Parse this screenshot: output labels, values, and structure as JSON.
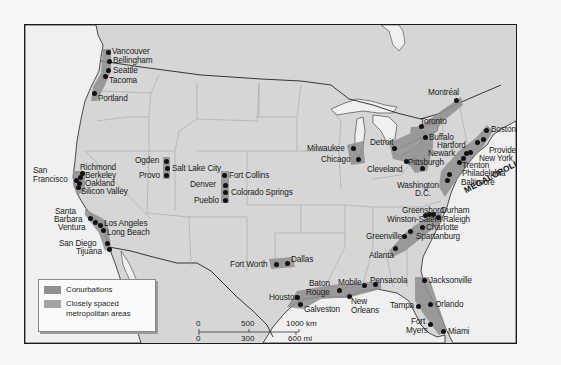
{
  "map": {
    "title": "Megalopolis and conurbations of North America",
    "colors": {
      "land": "#d6d6d6",
      "water": "#f0f0f0",
      "conurbation": "#8a8a8a",
      "metro_spaced": "#a3a3a3",
      "border": "#1a1a1a"
    },
    "region_label": "MEGALOPOLIS",
    "cities": [
      {
        "name": "Vancouver",
        "x": 107,
        "y": 51
      },
      {
        "name": "Bellingham",
        "x": 108,
        "y": 60
      },
      {
        "name": "Seattle",
        "x": 107,
        "y": 69
      },
      {
        "name": "Tacoma",
        "x": 104,
        "y": 75
      },
      {
        "name": "Portland",
        "x": 93,
        "y": 92
      },
      {
        "name": "Richmond",
        "x": 81,
        "y": 172
      },
      {
        "name": "Berkeley",
        "x": 80,
        "y": 176
      },
      {
        "name": "San Francisco",
        "x": 75,
        "y": 180
      },
      {
        "name": "Oakland",
        "x": 78,
        "y": 181
      },
      {
        "name": "Silicon Valley",
        "x": 77,
        "y": 186
      },
      {
        "name": "Ogden",
        "x": 165,
        "y": 160
      },
      {
        "name": "Salt Lake City",
        "x": 166,
        "y": 166
      },
      {
        "name": "Provo",
        "x": 165,
        "y": 174
      },
      {
        "name": "Fort Collins",
        "x": 223,
        "y": 174
      },
      {
        "name": "Denver",
        "x": 224,
        "y": 184
      },
      {
        "name": "Colorado Springs",
        "x": 224,
        "y": 191
      },
      {
        "name": "Pueblo",
        "x": 224,
        "y": 199
      },
      {
        "name": "Santa Barbara",
        "x": 89,
        "y": 214
      },
      {
        "name": "Ventura",
        "x": 93,
        "y": 219
      },
      {
        "name": "Los Angeles",
        "x": 99,
        "y": 223
      },
      {
        "name": "Long Beach",
        "x": 102,
        "y": 228
      },
      {
        "name": "San Diego",
        "x": 106,
        "y": 242
      },
      {
        "name": "Tijuana",
        "x": 108,
        "y": 247
      },
      {
        "name": "Fort Worth",
        "x": 275,
        "y": 263
      },
      {
        "name": "Dallas",
        "x": 286,
        "y": 262
      },
      {
        "name": "Milwaukee",
        "x": 352,
        "y": 147
      },
      {
        "name": "Chicago",
        "x": 357,
        "y": 158
      },
      {
        "name": "Detroit",
        "x": 393,
        "y": 147
      },
      {
        "name": "Cleveland",
        "x": 405,
        "y": 160
      },
      {
        "name": "Toronto",
        "x": 420,
        "y": 125
      },
      {
        "name": "Buffalo",
        "x": 424,
        "y": 136
      },
      {
        "name": "Montréal",
        "x": 455,
        "y": 99
      },
      {
        "name": "Pittsburgh",
        "x": 421,
        "y": 167
      },
      {
        "name": "Boston",
        "x": 485,
        "y": 129
      },
      {
        "name": "Hartford",
        "x": 476,
        "y": 141
      },
      {
        "name": "Providence",
        "x": 483,
        "y": 139
      },
      {
        "name": "Newark",
        "x": 464,
        "y": 152
      },
      {
        "name": "New York",
        "x": 469,
        "y": 150
      },
      {
        "name": "Trenton",
        "x": 461,
        "y": 157
      },
      {
        "name": "Philadelphia",
        "x": 458,
        "y": 161
      },
      {
        "name": "Baltimore",
        "x": 447,
        "y": 173
      },
      {
        "name": "Washington D.C.",
        "x": 446,
        "y": 179
      },
      {
        "name": "Greensboro",
        "x": 424,
        "y": 214
      },
      {
        "name": "Winston-Salem",
        "x": 424,
        "y": 215
      },
      {
        "name": "Durham",
        "x": 433,
        "y": 213
      },
      {
        "name": "Raleigh",
        "x": 438,
        "y": 216
      },
      {
        "name": "Charlotte",
        "x": 421,
        "y": 226
      },
      {
        "name": "Greenville",
        "x": 408,
        "y": 235
      },
      {
        "name": "Spartanburg",
        "x": 412,
        "y": 229
      },
      {
        "name": "Atlanta",
        "x": 394,
        "y": 246
      },
      {
        "name": "Houston",
        "x": 296,
        "y": 296
      },
      {
        "name": "Galveston",
        "x": 299,
        "y": 304
      },
      {
        "name": "Baton Rouge",
        "x": 338,
        "y": 289
      },
      {
        "name": "New Orleans",
        "x": 348,
        "y": 295
      },
      {
        "name": "Mobile",
        "x": 363,
        "y": 284
      },
      {
        "name": "Pensacola",
        "x": 374,
        "y": 283
      },
      {
        "name": "Jacksonville",
        "x": 423,
        "y": 279
      },
      {
        "name": "Tampa",
        "x": 417,
        "y": 305
      },
      {
        "name": "Orlando",
        "x": 429,
        "y": 303
      },
      {
        "name": "Fort Myers",
        "x": 429,
        "y": 323
      },
      {
        "name": "Miami",
        "x": 442,
        "y": 330
      }
    ],
    "labels": {
      "vancouver": "Vancouver",
      "bellingham": "Bellingham",
      "seattle": "Seattle",
      "tacoma": "Tacoma",
      "portland": "Portland",
      "san": "San",
      "francisco": "Francisco",
      "richmond": "Richmond",
      "berkeley": "Berkeley",
      "oakland": "Oakland",
      "silicon_valley": "Silicon Valley",
      "ogden": "Ogden",
      "salt_lake_city": "Salt Lake City",
      "provo": "Provo",
      "fort_collins": "Fort Collins",
      "denver": "Denver",
      "colorado_springs": "Colorado Springs",
      "pueblo": "Pueblo",
      "santa": "Santa",
      "barbara": "Barbara",
      "ventura": "Ventura",
      "los_angeles": "Los Angeles",
      "long_beach": "Long Beach",
      "san_diego": "San Diego",
      "tijuana": "Tijuana",
      "fort_worth": "Fort Worth",
      "dallas": "Dallas",
      "milwaukee": "Milwaukee",
      "chicago": "Chicago",
      "detroit": "Detroit",
      "cleveland": "Cleveland",
      "toronto": "Toronto",
      "buffalo": "Buffalo",
      "montreal": "Montréal",
      "pittsburgh": "Pittsburgh",
      "boston": "Boston",
      "hartford": "Hartford",
      "providence": "Providence",
      "newark": "Newark",
      "new_york": "New York",
      "trenton": "Trenton",
      "philadelphia": "Philadelphia",
      "baltimore": "Baltimore",
      "washington": "Washington",
      "dc": "D.C.",
      "greensboro": "Greensboro",
      "winston_salem": "Winston-Salem",
      "durham": "Durham",
      "raleigh": "Raleigh",
      "charlotte": "Charlotte",
      "greenville": "Greenville",
      "spartanburg": "Spartanburg",
      "atlanta": "Atlanta",
      "houston": "Houston",
      "galveston": "Galveston",
      "baton": "Baton",
      "rouge": "Rouge",
      "mobile": "Mobile",
      "pensacola": "Pensacola",
      "new": "New",
      "orleans": "Orleans",
      "jacksonville": "Jacksonville",
      "tampa": "Tampa",
      "orlando": "Orlando",
      "fort": "Fort",
      "myers": "Myers",
      "miami": "Miami"
    }
  },
  "legend": {
    "items": [
      {
        "label": "Conurbations",
        "color": "#8f8f8f"
      },
      {
        "label": "Closely spaced",
        "label2": "metropolitan areas",
        "color": "#a3a3a3"
      }
    ]
  },
  "scale_bar": {
    "km": {
      "zero": "0",
      "mid": "500",
      "end": "1000 km"
    },
    "mi": {
      "zero": "0",
      "mid": "300",
      "end": "600 mi"
    }
  }
}
